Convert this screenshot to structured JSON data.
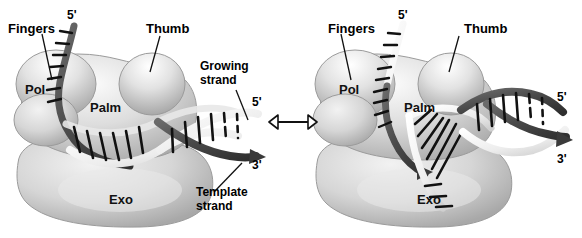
{
  "figure": {
    "type": "diagram",
    "panel_relation_symbol": "⟷"
  },
  "palette": {
    "background": "#ffffff",
    "protein_fill": "#cfcfcf",
    "protein_fill_light": "#e3e3e3",
    "protein_edge": "#9a9a9a",
    "strand_dark": "#4d4d4d",
    "strand_darker": "#3a3a3a",
    "strand_light": "#f0f0f0",
    "strand_light_edge": "#b8b8b8",
    "base_pair": "#111111",
    "text": "#000000"
  },
  "left_panel": {
    "name": "polymerizing-mode",
    "domains": [
      {
        "key": "fingers",
        "label": "Fingers",
        "callout": true
      },
      {
        "key": "thumb",
        "label": "Thumb",
        "callout": true
      },
      {
        "key": "pol",
        "label": "Pol",
        "callout": false
      },
      {
        "key": "palm",
        "label": "Palm",
        "callout": false
      },
      {
        "key": "exo",
        "label": "Exo",
        "callout": false
      }
    ],
    "strand_labels": [
      {
        "key": "growing",
        "label": "Growing\nstrand",
        "line1": "Growing",
        "line2": "strand"
      },
      {
        "key": "template",
        "label": "Template\nstrand",
        "line1": "Template",
        "line2": "strand"
      }
    ],
    "termini": [
      {
        "key": "template-5-prime",
        "label": "5'"
      },
      {
        "key": "growing-5-prime",
        "label": "5'"
      },
      {
        "key": "template-3-prime",
        "label": "3'"
      }
    ]
  },
  "right_panel": {
    "name": "editing-mode",
    "domains": [
      {
        "key": "fingers",
        "label": "Fingers",
        "callout": true
      },
      {
        "key": "thumb",
        "label": "Thumb",
        "callout": true
      },
      {
        "key": "pol",
        "label": "Pol",
        "callout": false
      },
      {
        "key": "palm",
        "label": "Palm",
        "callout": false
      },
      {
        "key": "exo",
        "label": "Exo",
        "callout": false
      }
    ],
    "strand_labels": [],
    "termini": [
      {
        "key": "template-5-prime",
        "label": "5'"
      },
      {
        "key": "duplex-5-prime",
        "label": "5'"
      },
      {
        "key": "template-3-prime",
        "label": "3'"
      }
    ]
  }
}
